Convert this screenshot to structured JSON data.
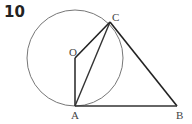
{
  "figure": {
    "number": "10",
    "labels": {
      "O": "O",
      "C": "C",
      "A": "A",
      "B": "B"
    },
    "points": {
      "O": [
        75,
        58
      ],
      "A": [
        75,
        106
      ],
      "C": [
        110,
        22
      ],
      "B": [
        177,
        106
      ]
    },
    "circle": {
      "center": "O",
      "radius": 48
    },
    "segments": [
      "OA",
      "OC",
      "AC",
      "CB",
      "AB"
    ],
    "colors": {
      "line": "#222222",
      "circle": "#777777"
    }
  }
}
